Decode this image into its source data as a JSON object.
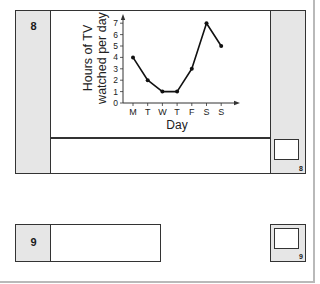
{
  "questions": [
    {
      "number": "8",
      "marks_label": "8"
    },
    {
      "number": "9",
      "marks_label": "9"
    }
  ],
  "chart_data": {
    "type": "line",
    "title": "",
    "xlabel": "Day",
    "ylabel": "Hours of TV watched per day",
    "ylabel_lines": [
      "Hours of TV",
      "watched per day"
    ],
    "categories": [
      "M",
      "T",
      "W",
      "T",
      "F",
      "S",
      "S"
    ],
    "values": [
      4,
      2,
      1,
      1,
      3,
      7,
      5
    ],
    "y_ticks": [
      0,
      1,
      2,
      3,
      4,
      5,
      6,
      7
    ],
    "ylim": [
      0,
      7
    ],
    "grid": false,
    "legend": null,
    "line_color": "#111111",
    "marker": "dot"
  }
}
